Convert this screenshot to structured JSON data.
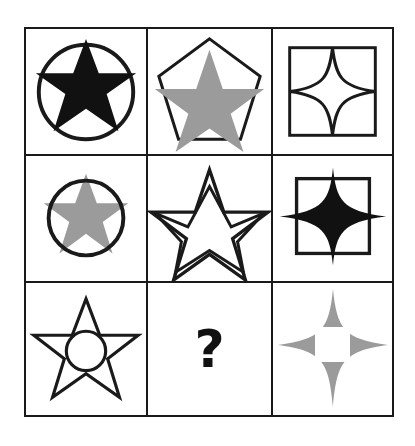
{
  "puzzle": {
    "type": "visual-analogy-matrix",
    "rows": 3,
    "columns": 3,
    "missing_cell": 8,
    "missing_marker": "?",
    "colors": {
      "stroke": "#1a1a1a",
      "fill_black": "#111111",
      "fill_gray": "#9b9b9b",
      "fill_white": "#ffffff",
      "background": "#ffffff"
    },
    "cells": [
      {
        "index": 1,
        "position": "row1-col1",
        "name": "black-six-point-star-in-circle",
        "inner_shape": "six-pointed-star",
        "inner_fill": "black",
        "outer_shape": "circle",
        "outer_fill": "none",
        "description": "Black six-pointed star whose points extend past a circle outline"
      },
      {
        "index": 2,
        "position": "row1-col2",
        "name": "gray-five-point-star-in-pentagon",
        "inner_shape": "five-pointed-star",
        "inner_fill": "gray",
        "outer_shape": "pentagon",
        "outer_fill": "none",
        "description": "Gray five-pointed star inside a pentagon outline"
      },
      {
        "index": 3,
        "position": "row1-col3",
        "name": "white-four-point-star-in-square",
        "inner_shape": "four-pointed-star",
        "inner_fill": "white",
        "outer_shape": "square",
        "outer_fill": "none",
        "description": "White four-pointed star outline touching a square outline"
      },
      {
        "index": 4,
        "position": "row2-col1",
        "name": "gray-six-point-star-with-circle",
        "inner_shape": "six-pointed-star",
        "inner_fill": "gray",
        "outer_shape": "circle",
        "outer_fill": "none",
        "description": "Gray six-pointed star overlaid by a smaller circle outline"
      },
      {
        "index": 5,
        "position": "row2-col2",
        "name": "white-double-five-point-star",
        "inner_shape": "five-pointed-star",
        "inner_fill": "white",
        "outer_shape": "five-pointed-star",
        "outer_fill": "none",
        "description": "White five-pointed star outline containing an inscribed pentagram"
      },
      {
        "index": 6,
        "position": "row2-col3",
        "name": "black-four-point-star-with-square",
        "inner_shape": "four-pointed-star",
        "inner_fill": "black",
        "outer_shape": "square",
        "outer_fill": "none",
        "description": "Black four-pointed star extending past a square outline"
      },
      {
        "index": 7,
        "position": "row3-col1",
        "name": "white-six-point-star-with-circle-hole",
        "inner_shape": "six-pointed-star",
        "inner_fill": "white",
        "outer_shape": "circle-hole",
        "outer_fill": "none",
        "description": "White six-pointed star outline with a small circle outline inside"
      },
      {
        "index": 8,
        "position": "row3-col2",
        "name": "missing-answer-cell",
        "inner_shape": "unknown",
        "inner_fill": "none",
        "outer_shape": "none",
        "outer_fill": "none",
        "description": "Question mark marking the missing element"
      },
      {
        "index": 9,
        "position": "row3-col3",
        "name": "gray-four-point-star-with-square-hole",
        "inner_shape": "four-pointed-star",
        "inner_fill": "gray",
        "outer_shape": "square-hole",
        "outer_fill": "white",
        "description": "Gray four-pointed star with a white square hole at its centre"
      }
    ]
  }
}
